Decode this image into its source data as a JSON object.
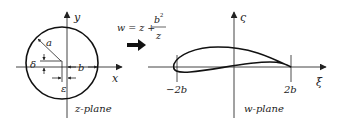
{
  "z_plane": {
    "label": "z-plane",
    "x_axis_label": "x",
    "y_axis_label": "y",
    "radius_label": "a",
    "delta_label": "δ",
    "epsilon_label": "ε",
    "b_label": "b"
  },
  "transform": {
    "lhs": "w = z +",
    "numerator": "b",
    "numerator_exp": "2",
    "denominator": "z"
  },
  "w_plane": {
    "label": "w-plane",
    "x_axis_label": "ξ",
    "y_axis_label": "ς",
    "left_tick": "−2b",
    "right_tick": "2b"
  },
  "colors": {
    "ink": "#222222",
    "background": "#ffffff"
  }
}
